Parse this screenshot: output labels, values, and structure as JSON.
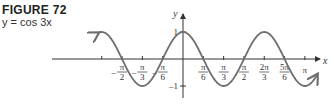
{
  "figure": {
    "title": "FIGURE 72",
    "caption": "y = cos 3x"
  },
  "colors": {
    "curve": "#6e6e6e",
    "axis": "#333333",
    "text": "#333333"
  },
  "chart_data": {
    "type": "line",
    "title": "FIGURE 72",
    "subtitle": "y = cos 3x",
    "xlabel": "x",
    "ylabel": "y",
    "function": "cos(3x)",
    "x_range": [
      -2.2,
      3.45
    ],
    "y_range": [
      -1,
      1
    ],
    "x_ticks": [
      {
        "value": -1.5708,
        "label": "-π/2"
      },
      {
        "value": -1.0472,
        "label": "-π/3"
      },
      {
        "value": -0.5236,
        "label": "-π/6"
      },
      {
        "value": 0.5236,
        "label": "π/6"
      },
      {
        "value": 1.0472,
        "label": "π/3"
      },
      {
        "value": 1.5708,
        "label": "π/2"
      },
      {
        "value": 2.0944,
        "label": "2π/3"
      },
      {
        "value": 2.618,
        "label": "5π/6"
      },
      {
        "value": 3.1416,
        "label": "π"
      }
    ],
    "y_ticks": [
      {
        "value": 1,
        "label": "1"
      },
      {
        "value": -1,
        "label": "-1"
      }
    ],
    "grid": false,
    "legend": null
  }
}
